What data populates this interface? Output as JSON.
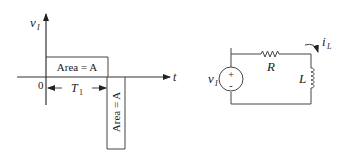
{
  "waveform": {
    "y_axis_label": "v",
    "y_axis_label_sub": "I",
    "x_axis_label": "t",
    "origin_label": "0",
    "positive_pulse_label": "Area = A",
    "negative_pulse_label": "Area = A",
    "duration_label": "T",
    "duration_label_sub": "1"
  },
  "circuit": {
    "source_label": "v",
    "source_label_sub": "I",
    "source_plus": "+",
    "source_minus": "-",
    "resistor_label": "R",
    "inductor_label": "L",
    "current_label": "i",
    "current_label_sub": "L"
  }
}
